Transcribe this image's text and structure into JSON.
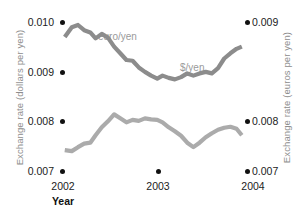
{
  "chart_data": {
    "type": "line",
    "title": "",
    "xlabel": "Year",
    "ylabel_left": "Exchange rate (dollars per yen)",
    "ylabel_right": "Exchange rate (euros per yen)",
    "grid": false,
    "legend": "inline-series-labels",
    "x_ticks": [
      "2002",
      "2003",
      "2004"
    ],
    "x_tick_values": [
      2002,
      2003,
      2004
    ],
    "xlim": [
      2002.0,
      2004.1
    ],
    "y_left_ticks": [
      "0.007",
      "0.008",
      "0.009",
      "0.010"
    ],
    "y_left_values": [
      0.007,
      0.008,
      0.009,
      0.01
    ],
    "ylim_left": [
      0.007,
      0.01
    ],
    "y_right_ticks": [
      "0.007",
      "0.008",
      "0.009"
    ],
    "y_right_values": [
      0.007,
      0.008,
      0.009
    ],
    "ylim_right": [
      0.00655,
      0.00925
    ],
    "series": [
      {
        "name": "euro/yen",
        "axis": "right",
        "color": "#8c8c8c",
        "label_text": "euro/yen",
        "x": [
          2002.02,
          2002.1,
          2002.17,
          2002.24,
          2002.31,
          2002.37,
          2002.44,
          2002.51,
          2002.58,
          2002.65,
          2002.72,
          2002.79,
          2002.86,
          2002.93,
          2003.0,
          2003.07,
          2003.13,
          2003.2,
          2003.27,
          2003.34,
          2003.41,
          2003.48,
          2003.55,
          2003.62,
          2003.69,
          2003.76,
          2003.83,
          2003.9,
          2003.97,
          2004.03
        ],
        "values": [
          0.0088,
          0.00893,
          0.00896,
          0.00889,
          0.00886,
          0.00878,
          0.00884,
          0.00879,
          0.00867,
          0.00858,
          0.00849,
          0.00848,
          0.00839,
          0.00833,
          0.00828,
          0.00824,
          0.00828,
          0.00825,
          0.00823,
          0.00826,
          0.00831,
          0.00828,
          0.00831,
          0.00833,
          0.00831,
          0.00838,
          0.00851,
          0.00858,
          0.00864,
          0.00867
        ]
      },
      {
        "name": "$/yen",
        "axis": "left",
        "color": "#ababab",
        "label_text": "$/yen",
        "x": [
          2002.02,
          2002.1,
          2002.17,
          2002.24,
          2002.31,
          2002.37,
          2002.44,
          2002.51,
          2002.58,
          2002.65,
          2002.72,
          2002.79,
          2002.86,
          2002.93,
          2003.0,
          2003.07,
          2003.13,
          2003.2,
          2003.27,
          2003.34,
          2003.41,
          2003.48,
          2003.55,
          2003.62,
          2003.69,
          2003.76,
          2003.83,
          2003.9,
          2003.97,
          2004.03
        ],
        "values": [
          0.00742,
          0.0074,
          0.00748,
          0.00755,
          0.00757,
          0.00772,
          0.00788,
          0.008,
          0.00814,
          0.00806,
          0.00798,
          0.00803,
          0.00801,
          0.00806,
          0.00804,
          0.00803,
          0.00798,
          0.00788,
          0.0078,
          0.00771,
          0.00757,
          0.00748,
          0.00757,
          0.00768,
          0.00776,
          0.00783,
          0.00787,
          0.00789,
          0.00785,
          0.00772
        ]
      }
    ]
  },
  "axes": {
    "left_title": "Exchange rate (dollars per yen)",
    "right_title": "Exchange rate (euros per yen)",
    "x_title": "Year"
  },
  "ticks": {
    "left": [
      {
        "label": "0.010",
        "top": 21
      },
      {
        "label": "0.009",
        "top": 71
      },
      {
        "label": "0.008",
        "top": 120
      },
      {
        "label": "0.007",
        "top": 170
      }
    ],
    "right": [
      {
        "label": "0.009",
        "top": 21
      },
      {
        "label": "0.008",
        "top": 120
      },
      {
        "label": "0.007",
        "top": 170
      }
    ],
    "x": [
      {
        "label": "2002",
        "left": 43
      },
      {
        "label": "2003",
        "left": 138
      },
      {
        "label": "2004",
        "left": 233
      }
    ]
  },
  "series_labels": [
    {
      "text": "euro/yen",
      "left": 98,
      "top": 36
    },
    {
      "text": "$/yen",
      "left": 180,
      "top": 66
    }
  ],
  "colors": {
    "euro_yen": "#8c8c8c",
    "dollar_yen": "#ababab",
    "tick_dot": "#111111",
    "axis_title": "#8d8d8d",
    "tick_text": "#1c1c1c",
    "background": "#ffffff"
  }
}
